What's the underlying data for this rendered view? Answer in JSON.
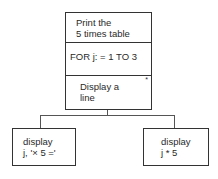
{
  "diagram": {
    "type": "structure-chart",
    "root": {
      "title_line1": "Print the",
      "title_line2": "5 times table",
      "loop": "FOR j: = 1 TO 3",
      "body_line1": "Display a",
      "body_line2": "line",
      "iteration_marker": "*"
    },
    "children": [
      {
        "line1": "display",
        "line2": "j, '× 5 ='"
      },
      {
        "line1": "display",
        "line2": "j * 5"
      }
    ]
  }
}
